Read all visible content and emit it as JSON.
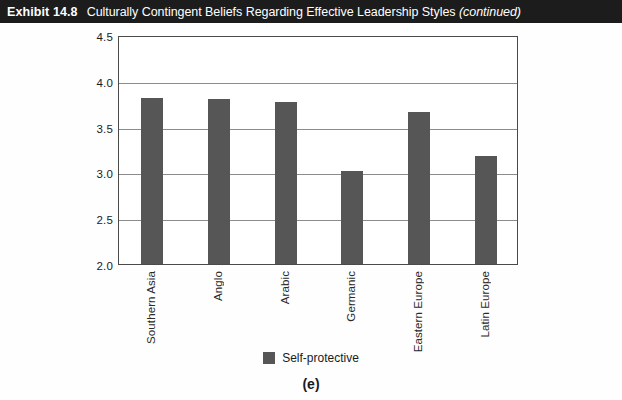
{
  "header": {
    "label": "Exhibit 14.8",
    "title": "Culturally Contingent Beliefs Regarding Effective Leadership Styles",
    "continued": "(continued)"
  },
  "panel_caption": "(e)",
  "legend": {
    "series_label": "Self-protective",
    "swatch_color": "#565656"
  },
  "chart_data": {
    "type": "bar",
    "title": "",
    "xlabel": "",
    "ylabel": "",
    "categories": [
      "Southern Asia",
      "Anglo",
      "Arabic",
      "Germanic",
      "Eastern Europe",
      "Latin Europe"
    ],
    "series": [
      {
        "name": "Self-protective",
        "color": "#565656",
        "values": [
          3.81,
          3.8,
          3.77,
          3.02,
          3.66,
          3.18
        ]
      }
    ],
    "ylim": [
      2.0,
      4.5
    ],
    "yticks": [
      "2.0",
      "2.5",
      "3.0",
      "3.5",
      "4.0",
      "4.5"
    ],
    "ytick_values": [
      2.0,
      2.5,
      3.0,
      3.5,
      4.0,
      4.5
    ],
    "grid": true,
    "legend_position": "bottom"
  }
}
